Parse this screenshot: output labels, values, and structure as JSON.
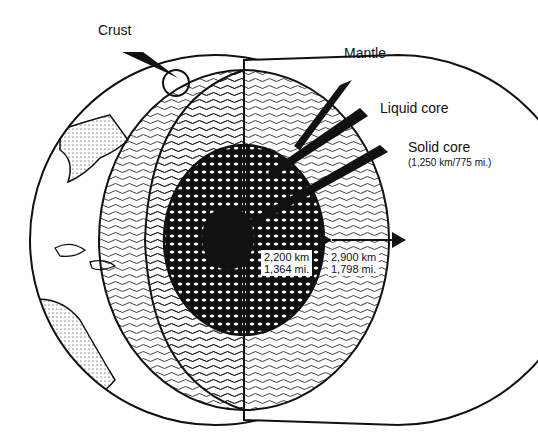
{
  "diagram": {
    "labels": {
      "crust": "Crust",
      "mantle": "Mantle",
      "liquid_core": "Liquid core",
      "solid_core": "Solid core",
      "solid_core_size": "(1,250 km/775 mi.)"
    },
    "dimensions": {
      "core_radius_km": "2,200 km",
      "core_radius_mi": "1,364 mi.",
      "mantle_thickness_km": "2,900 km",
      "mantle_thickness_mi": "1,798 mi."
    },
    "colors": {
      "ink": "#111111",
      "background": "#ffffff"
    }
  }
}
